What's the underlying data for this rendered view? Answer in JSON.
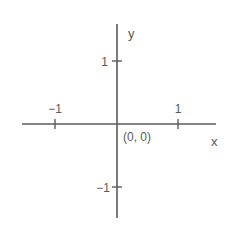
{
  "diagram": {
    "type": "cartesian-plane",
    "axes": {
      "x_label": "x",
      "y_label": "y",
      "color": "#5c5c5c"
    },
    "ticks": {
      "x_neg": "−1",
      "x_pos": "1",
      "y_pos": "1",
      "y_neg": "−1"
    },
    "origin_label": "(0, 0)"
  }
}
